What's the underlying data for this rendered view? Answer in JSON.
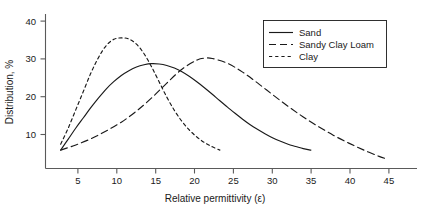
{
  "chart_data": {
    "type": "line",
    "title": "",
    "xlabel": "Relative  permittivity (ε)",
    "ylabel": "Distribution, %",
    "xlim": [
      0,
      49
    ],
    "ylim": [
      0,
      42
    ],
    "xticks": [
      5,
      10,
      15,
      20,
      25,
      30,
      35,
      40,
      45
    ],
    "xtick_labels": [
      "5",
      "10",
      "15",
      "20",
      "25",
      "30",
      "35",
      "40",
      "45"
    ],
    "yticks": [
      10,
      20,
      30,
      40
    ],
    "ytick_labels": [
      "10",
      "20",
      "30",
      "40"
    ],
    "grid": false,
    "legend_position": "upper right",
    "series": [
      {
        "name": "Sand",
        "dash": "solid",
        "peak_x": 14,
        "peak_y": 28.5,
        "x": [
          2,
          3,
          4,
          5,
          6,
          7,
          8,
          9,
          10,
          11,
          12,
          13,
          14,
          15,
          16,
          17,
          18,
          19,
          20,
          21,
          22,
          23,
          24,
          25,
          26,
          27,
          28,
          29,
          30,
          31,
          32,
          33,
          34,
          35
        ],
        "y": [
          5.0,
          8.0,
          11.0,
          13.8,
          16.6,
          19.2,
          21.6,
          23.6,
          25.3,
          26.6,
          27.6,
          28.2,
          28.5,
          28.4,
          28.0,
          27.3,
          26.3,
          25.0,
          23.5,
          21.9,
          20.2,
          18.4,
          16.7,
          15.0,
          13.4,
          11.9,
          10.6,
          9.4,
          8.3,
          7.4,
          6.6,
          6.0,
          5.4,
          5.0
        ]
      },
      {
        "name": "Sandy Clay Loam",
        "dash": "long-dash",
        "peak_x": 21,
        "peak_y": 30.0,
        "x": [
          2,
          4,
          6,
          8,
          10,
          12,
          14,
          16,
          18,
          20,
          21,
          22,
          24,
          26,
          28,
          30,
          32,
          34,
          36,
          38,
          40,
          42,
          44,
          45
        ],
        "y": [
          5.0,
          6.4,
          8.1,
          10.2,
          12.6,
          15.6,
          19.2,
          23.2,
          27.0,
          29.5,
          30.0,
          29.9,
          28.6,
          26.2,
          23.2,
          20.0,
          16.9,
          14.0,
          11.4,
          9.0,
          6.9,
          5.0,
          3.3,
          2.6
        ]
      },
      {
        "name": "Clay",
        "dash": "short-dash",
        "peak_x": 10,
        "peak_y": 35.5,
        "x": [
          2,
          3,
          4,
          5,
          6,
          7,
          8,
          9,
          10,
          11,
          12,
          13,
          14,
          15,
          16,
          17,
          18,
          19,
          20,
          21,
          22,
          23
        ],
        "y": [
          6.6,
          11.0,
          16.0,
          21.0,
          26.0,
          30.2,
          33.4,
          35.1,
          35.5,
          35.2,
          33.8,
          31.2,
          27.6,
          23.5,
          19.4,
          15.8,
          12.8,
          10.4,
          8.5,
          7.0,
          5.9,
          5.0
        ]
      }
    ]
  },
  "legend": {
    "items": [
      {
        "label": "Sand",
        "dash": "solid"
      },
      {
        "label": "Sandy Clay Loam",
        "dash": "long-dash"
      },
      {
        "label": "Clay",
        "dash": "short-dash"
      }
    ]
  }
}
